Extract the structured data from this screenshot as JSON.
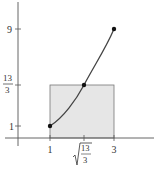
{
  "figure": {
    "colors": {
      "axis": "#555555",
      "curve": "#444444",
      "rectangle_fill": "#e6e6e6",
      "rectangle_stroke": "#666666",
      "point": "#111111"
    },
    "y_ticks": [
      {
        "label": "9",
        "value": 9
      },
      {
        "label_num": "13",
        "label_den": "3",
        "value": 4.333
      },
      {
        "label": "1",
        "value": 1
      }
    ],
    "x_ticks": [
      {
        "label": "1",
        "value": 1
      },
      {
        "label_sqrt_num": "13",
        "label_sqrt_den": "3",
        "value": 2.082
      },
      {
        "label": "3",
        "value": 3
      }
    ],
    "points": [
      {
        "x": 1,
        "y": 1
      },
      {
        "x": 2.082,
        "y": 4.333
      },
      {
        "x": 3,
        "y": 9
      }
    ],
    "rectangle": {
      "x_from": 1,
      "x_to": 3,
      "height": 4.333
    }
  }
}
